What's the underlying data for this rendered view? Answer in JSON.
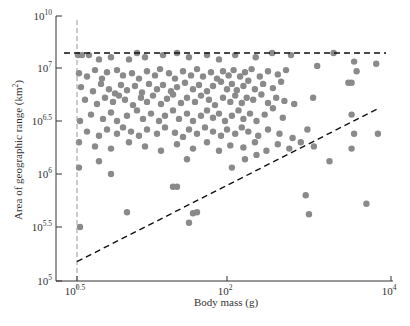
{
  "chart_data": {
    "type": "scatter",
    "title": "",
    "xlabel": "Body mass (g)",
    "ylabel": "Area of geographic range (km²)",
    "x_scale": "log10",
    "y_scale": "log10",
    "xlim_log10": [
      0.5,
      4
    ],
    "ylim_log10": [
      5,
      10
    ],
    "x_ticks": [
      {
        "base": "10",
        "exp": "0.5",
        "value_log10": 0.5
      },
      {
        "base": "10",
        "exp": "2",
        "value_log10": 2
      },
      {
        "base": "10",
        "exp": "4",
        "value_log10": 4
      }
    ],
    "y_ticks": [
      {
        "base": "10",
        "exp": "5",
        "value_log10": 5
      },
      {
        "base": "10",
        "exp": "5.5",
        "value_log10": 5.5
      },
      {
        "base": "10",
        "exp": "6",
        "value_log10": 6
      },
      {
        "base": "10",
        "exp": "6.5",
        "value_log10": 6.5
      },
      {
        "base": "10",
        "exp": "7",
        "value_log10": 7
      },
      {
        "base": "10",
        "exp": "10",
        "value_log10": 10
      }
    ],
    "y_axis_break": "compressed between 10^7 and 10^10",
    "grid": false,
    "legend": null,
    "reference_lines": [
      {
        "name": "upper-bound",
        "style": "dashed",
        "color": "#111111",
        "from": [
          0.5,
          7.14
        ],
        "to": [
          4,
          7.14
        ]
      },
      {
        "name": "lower-bound",
        "style": "dashed",
        "color": "#111111",
        "from": [
          0.5,
          5.18
        ],
        "to": [
          3.85,
          6.62
        ]
      },
      {
        "name": "min-body-mass",
        "style": "dashed",
        "color": "#999999",
        "vertical_at_log10": 0.5
      }
    ],
    "point_color": "#8a8a8a",
    "series": [
      {
        "name": "species",
        "points_log10": [
          [
            0.51,
            7.12
          ],
          [
            0.55,
            7.12
          ],
          [
            0.62,
            7.12
          ],
          [
            0.72,
            7.08
          ],
          [
            0.84,
            7.1
          ],
          [
            1.02,
            7.08
          ],
          [
            1.1,
            7.14
          ],
          [
            1.18,
            7.1
          ],
          [
            1.36,
            7.12
          ],
          [
            1.5,
            7.14
          ],
          [
            1.62,
            7.1
          ],
          [
            1.8,
            7.12
          ],
          [
            1.92,
            7.08
          ],
          [
            2.1,
            7.12
          ],
          [
            2.35,
            7.1
          ],
          [
            2.55,
            7.14
          ],
          [
            2.78,
            7.12
          ],
          [
            3.3,
            7.14
          ],
          [
            3.55,
            7.06
          ],
          [
            3.82,
            7.04
          ],
          [
            0.52,
            6.95
          ],
          [
            0.6,
            6.92
          ],
          [
            0.68,
            6.98
          ],
          [
            0.75,
            6.9
          ],
          [
            0.8,
            6.96
          ],
          [
            0.9,
            6.98
          ],
          [
            0.96,
            6.93
          ],
          [
            1.05,
            6.95
          ],
          [
            1.12,
            6.9
          ],
          [
            1.2,
            6.97
          ],
          [
            1.28,
            6.93
          ],
          [
            1.33,
            6.99
          ],
          [
            1.42,
            6.95
          ],
          [
            1.48,
            6.9
          ],
          [
            1.56,
            6.97
          ],
          [
            1.64,
            6.93
          ],
          [
            1.7,
            6.99
          ],
          [
            1.76,
            6.92
          ],
          [
            1.84,
            6.96
          ],
          [
            1.9,
            6.9
          ],
          [
            1.96,
            6.97
          ],
          [
            2.02,
            6.93
          ],
          [
            2.08,
            6.98
          ],
          [
            2.16,
            6.92
          ],
          [
            2.22,
            6.96
          ],
          [
            2.3,
            6.99
          ],
          [
            2.4,
            6.92
          ],
          [
            2.5,
            6.97
          ],
          [
            2.62,
            6.94
          ],
          [
            2.72,
            6.98
          ],
          [
            3.1,
            7.02
          ],
          [
            3.58,
            6.97
          ],
          [
            0.54,
            6.82
          ],
          [
            0.66,
            6.78
          ],
          [
            0.74,
            6.85
          ],
          [
            0.82,
            6.8
          ],
          [
            0.88,
            6.76
          ],
          [
            0.94,
            6.84
          ],
          [
            1.0,
            6.79
          ],
          [
            1.08,
            6.83
          ],
          [
            1.15,
            6.77
          ],
          [
            1.22,
            6.85
          ],
          [
            1.3,
            6.8
          ],
          [
            1.36,
            6.84
          ],
          [
            1.44,
            6.78
          ],
          [
            1.5,
            6.82
          ],
          [
            1.58,
            6.86
          ],
          [
            1.66,
            6.8
          ],
          [
            1.72,
            6.84
          ],
          [
            1.8,
            6.78
          ],
          [
            1.86,
            6.83
          ],
          [
            1.94,
            6.87
          ],
          [
            2.0,
            6.8
          ],
          [
            2.06,
            6.85
          ],
          [
            2.12,
            6.79
          ],
          [
            2.2,
            6.83
          ],
          [
            2.26,
            6.88
          ],
          [
            2.34,
            6.8
          ],
          [
            2.44,
            6.85
          ],
          [
            2.56,
            6.81
          ],
          [
            2.66,
            6.87
          ],
          [
            3.48,
            6.86
          ],
          [
            3.52,
            6.86
          ],
          [
            0.58,
            6.7
          ],
          [
            0.7,
            6.66
          ],
          [
            0.78,
            6.72
          ],
          [
            0.86,
            6.68
          ],
          [
            0.92,
            6.74
          ],
          [
            0.98,
            6.7
          ],
          [
            1.06,
            6.65
          ],
          [
            1.14,
            6.72
          ],
          [
            1.2,
            6.68
          ],
          [
            1.26,
            6.74
          ],
          [
            1.34,
            6.66
          ],
          [
            1.4,
            6.71
          ],
          [
            1.46,
            6.75
          ],
          [
            1.54,
            6.67
          ],
          [
            1.6,
            6.72
          ],
          [
            1.68,
            6.68
          ],
          [
            1.74,
            6.74
          ],
          [
            1.82,
            6.7
          ],
          [
            1.88,
            6.65
          ],
          [
            1.96,
            6.72
          ],
          [
            2.04,
            6.68
          ],
          [
            2.1,
            6.74
          ],
          [
            2.18,
            6.67
          ],
          [
            2.24,
            6.72
          ],
          [
            2.32,
            6.7
          ],
          [
            2.42,
            6.75
          ],
          [
            2.5,
            6.67
          ],
          [
            2.6,
            6.72
          ],
          [
            2.7,
            6.69
          ],
          [
            2.82,
            6.66
          ],
          [
            3.05,
            6.72
          ],
          [
            0.53,
            6.5
          ],
          [
            0.64,
            6.56
          ],
          [
            0.76,
            6.52
          ],
          [
            0.84,
            6.58
          ],
          [
            0.9,
            6.5
          ],
          [
            1.0,
            6.55
          ],
          [
            1.1,
            6.6
          ],
          [
            1.16,
            6.52
          ],
          [
            1.24,
            6.57
          ],
          [
            1.32,
            6.5
          ],
          [
            1.38,
            6.55
          ],
          [
            1.46,
            6.6
          ],
          [
            1.52,
            6.52
          ],
          [
            1.6,
            6.57
          ],
          [
            1.66,
            6.5
          ],
          [
            1.74,
            6.55
          ],
          [
            1.8,
            6.6
          ],
          [
            1.86,
            6.53
          ],
          [
            1.92,
            6.57
          ],
          [
            1.98,
            6.5
          ],
          [
            2.06,
            6.55
          ],
          [
            2.14,
            6.6
          ],
          [
            2.2,
            6.52
          ],
          [
            2.28,
            6.57
          ],
          [
            2.36,
            6.5
          ],
          [
            2.46,
            6.56
          ],
          [
            2.56,
            6.62
          ],
          [
            2.68,
            6.53
          ],
          [
            3.52,
            6.56
          ],
          [
            0.6,
            6.4
          ],
          [
            0.72,
            6.36
          ],
          [
            0.8,
            6.42
          ],
          [
            0.9,
            6.38
          ],
          [
            0.96,
            6.44
          ],
          [
            1.04,
            6.4
          ],
          [
            1.12,
            6.36
          ],
          [
            1.2,
            6.42
          ],
          [
            1.3,
            6.38
          ],
          [
            1.38,
            6.44
          ],
          [
            1.48,
            6.39
          ],
          [
            1.56,
            6.35
          ],
          [
            1.62,
            6.42
          ],
          [
            1.7,
            6.38
          ],
          [
            1.78,
            6.44
          ],
          [
            1.86,
            6.4
          ],
          [
            1.94,
            6.36
          ],
          [
            2.0,
            6.42
          ],
          [
            2.1,
            6.38
          ],
          [
            2.18,
            6.44
          ],
          [
            2.26,
            6.4
          ],
          [
            2.38,
            6.36
          ],
          [
            2.5,
            6.42
          ],
          [
            2.64,
            6.38
          ],
          [
            2.8,
            6.34
          ],
          [
            2.98,
            6.42
          ],
          [
            3.55,
            6.38
          ],
          [
            3.84,
            6.38
          ],
          [
            0.52,
            6.3
          ],
          [
            0.68,
            6.26
          ],
          [
            0.84,
            6.24
          ],
          [
            1.02,
            6.3
          ],
          [
            1.18,
            6.26
          ],
          [
            1.34,
            6.22
          ],
          [
            1.5,
            6.28
          ],
          [
            1.66,
            6.24
          ],
          [
            1.8,
            6.3
          ],
          [
            1.92,
            6.22
          ],
          [
            2.04,
            6.27
          ],
          [
            2.2,
            6.25
          ],
          [
            2.34,
            6.3
          ],
          [
            2.48,
            6.22
          ],
          [
            2.62,
            6.28
          ],
          [
            2.76,
            6.24
          ],
          [
            2.9,
            6.3
          ],
          [
            3.06,
            6.26
          ],
          [
            3.52,
            6.24
          ],
          [
            0.52,
            6.06
          ],
          [
            0.72,
            6.12
          ],
          [
            0.84,
            6.0
          ],
          [
            1.6,
            6.14
          ],
          [
            2.06,
            6.06
          ],
          [
            2.22,
            6.14
          ],
          [
            2.36,
            6.18
          ],
          [
            3.25,
            6.12
          ],
          [
            1.46,
            5.88
          ],
          [
            1.5,
            5.88
          ],
          [
            2.96,
            5.8
          ],
          [
            3.7,
            5.72
          ],
          [
            3.0,
            5.62
          ],
          [
            1.0,
            5.64
          ],
          [
            1.66,
            5.63
          ],
          [
            1.7,
            5.64
          ],
          [
            1.62,
            5.54
          ],
          [
            0.53,
            5.5
          ]
        ]
      }
    ]
  },
  "axes": {
    "x_title": "Body mass (g)",
    "y_title_main": "Area of geographic range (km",
    "y_title_sup": "2",
    "y_title_end": ")"
  }
}
